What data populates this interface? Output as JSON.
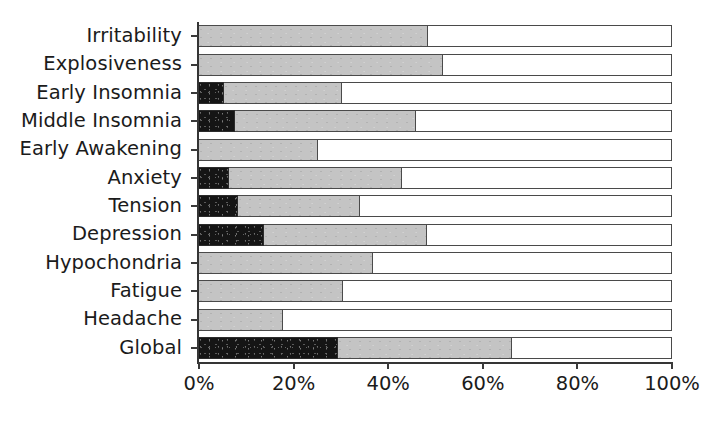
{
  "chart_data": {
    "type": "bar",
    "orientation": "horizontal",
    "stacked": true,
    "title": "",
    "xlabel": "",
    "ylabel": "",
    "xlim": [
      0,
      100
    ],
    "xticks": [
      0,
      20,
      40,
      60,
      80,
      100
    ],
    "xtick_labels": [
      "0%",
      "20%",
      "40%",
      "60%",
      "80%",
      "100%"
    ],
    "grid": false,
    "legend": "none",
    "categories": [
      "Irritability",
      "Explosiveness",
      "Early Insomnia",
      "Middle Insomnia",
      "Early Awakening",
      "Anxiety",
      "Tension",
      "Depression",
      "Hypochondria",
      "Fatigue",
      "Headache",
      "Global"
    ],
    "series": [
      {
        "name": "severe",
        "color": "#151515",
        "values": [
          0,
          0,
          5.3,
          7.6,
          0,
          6.3,
          8.2,
          13.7,
          0,
          0,
          0,
          29.4
        ]
      },
      {
        "name": "moderate",
        "color": "#c4c4c4",
        "values": [
          48.4,
          51.6,
          24.9,
          38.3,
          25.2,
          36.6,
          25.8,
          34.5,
          36.8,
          30.4,
          17.8,
          36.8
        ]
      },
      {
        "name": "none",
        "color": "#ffffff",
        "values": [
          51.6,
          48.4,
          69.8,
          54.1,
          74.8,
          57.1,
          66.0,
          51.8,
          63.2,
          69.6,
          82.2,
          33.8
        ]
      }
    ],
    "cumulative_endpoints": {
      "dark_end": [
        0,
        0,
        5.3,
        7.6,
        0,
        6.3,
        8.2,
        13.7,
        0,
        0,
        0,
        29.4
      ],
      "mid_end": [
        48.4,
        51.6,
        30.2,
        45.9,
        25.2,
        42.9,
        34.0,
        48.2,
        36.8,
        30.4,
        17.8,
        66.2
      ]
    }
  },
  "colors": {
    "dark": "#151515",
    "mid": "#c4c4c4",
    "light": "#ffffff",
    "axis": "#353535",
    "text": "#1b1b1b"
  }
}
